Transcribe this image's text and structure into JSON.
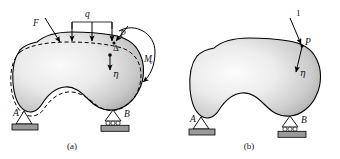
{
  "figure": {
    "background_color": "#ffffff",
    "line_color": "#000000",
    "body_fill_light": "#f2f2f2",
    "body_fill_mid": "#d8d8d8",
    "body_fill_dark": "#a8a8a8",
    "ground_color": "#9a9a9a"
  },
  "panels": [
    {
      "id": "panel-a",
      "caption": "(a)",
      "description": "Elastic body with concentrated force F, distributed load q, force P and moment Me; dashed line shows deformed shape",
      "supports": [
        {
          "id": "support-a",
          "label": "A",
          "type": "pin"
        },
        {
          "id": "support-b",
          "label": "B",
          "type": "roller"
        }
      ],
      "loads": [
        {
          "id": "force-f",
          "label": "F",
          "type": "concentrated-force",
          "direction": "down-right"
        },
        {
          "id": "load-q",
          "label": "q",
          "type": "distributed-load",
          "arrow_count": 3,
          "direction": "down"
        },
        {
          "id": "force-p",
          "label": "P",
          "type": "concentrated-force",
          "direction": "down-left"
        },
        {
          "id": "moment-me",
          "label": "M",
          "subscript": "e",
          "type": "moment",
          "direction": "counterclockwise"
        }
      ],
      "annotations": [
        {
          "id": "displacement-delta",
          "label": "Δ",
          "type": "displacement-point"
        },
        {
          "id": "direction-eta",
          "label": "η",
          "type": "direction-arrow",
          "direction": "down"
        }
      ]
    },
    {
      "id": "panel-b",
      "caption": "(b)",
      "description": "Same elastic body loaded by a single unit load at point P in direction eta",
      "supports": [
        {
          "id": "support-a",
          "label": "A",
          "type": "pin"
        },
        {
          "id": "support-b",
          "label": "B",
          "type": "roller"
        }
      ],
      "loads": [
        {
          "id": "unit-load",
          "label": "1",
          "type": "unit-load",
          "direction": "down-right"
        },
        {
          "id": "point-p",
          "label": "P",
          "type": "load-point"
        }
      ],
      "annotations": [
        {
          "id": "direction-eta",
          "label": "η",
          "type": "direction-arrow",
          "direction": "down"
        }
      ]
    }
  ]
}
